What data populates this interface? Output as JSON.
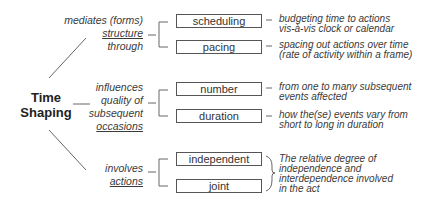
{
  "central_concept": {
    "line1": "Time",
    "line2": "Shaping"
  },
  "branches": [
    {
      "label_lines": [
        "mediates (forms)",
        "structure",
        "through"
      ],
      "underlined_line": "structure",
      "items": [
        {
          "label": "scheduling",
          "description": [
            "budgeting time to actions",
            "vis-à-vis clock or calendar"
          ]
        },
        {
          "label": "pacing",
          "description": [
            "spacing out actions over time",
            "(rate of activity within a frame)"
          ]
        }
      ]
    },
    {
      "label_lines": [
        "influences",
        "quality of",
        "subsequent",
        "occasions"
      ],
      "underlined_line": "occasions",
      "items": [
        {
          "label": "number",
          "description": [
            "from one to many subsequent",
            "events affected"
          ]
        },
        {
          "label": "duration",
          "description": [
            "how the(se) events vary from",
            "short to long in duration"
          ]
        }
      ]
    },
    {
      "label_lines": [
        "involves",
        "actions"
      ],
      "underlined_line": "actions",
      "items": [
        {
          "label": "independent"
        },
        {
          "label": "joint"
        }
      ],
      "shared_description": [
        "The relative degree of",
        "independence and",
        "interdependence involved",
        "in the act"
      ]
    }
  ],
  "colors": {
    "line": "#666666",
    "text": "#333333",
    "box_border": "#555555"
  }
}
